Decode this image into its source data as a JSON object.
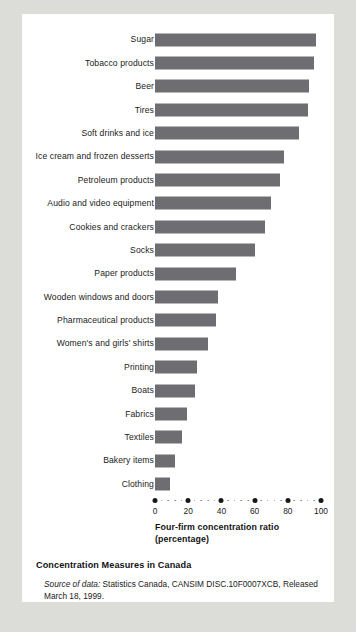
{
  "caption": {
    "title": "Concentration Measures in Canada",
    "source_lead": "Source of data:",
    "source_rest": " Statistics Canada, CANSIM DISC.10F0007XCB, Released March 18, 1999."
  },
  "colors": {
    "bar": "#6e6e72",
    "card": "#ffffff",
    "page": "#dcdcd8",
    "text": "#1b1b1b"
  },
  "chart_data": {
    "type": "bar",
    "orientation": "horizontal",
    "title": "Concentration Measures in Canada",
    "xlabel": "Four-firm concentration ratio (percentage)",
    "xlabel_line1": "Four-firm concentration ratio",
    "xlabel_line2": "(percentage)",
    "ylabel": "",
    "xlim": [
      0,
      100
    ],
    "grid": false,
    "legend": "none",
    "xticks": [
      0,
      20,
      40,
      60,
      80,
      100
    ],
    "xticklabels": [
      "0",
      "20",
      "40",
      "60",
      "80",
      "100"
    ],
    "categories": [
      "Sugar",
      "Tobacco products",
      "Beer",
      "Tires",
      "Soft drinks and ice",
      "Ice cream and frozen desserts",
      "Petroleum products",
      "Audio and video equipment",
      "Cookies and crackers",
      "Socks",
      "Paper products",
      "Wooden windows and doors",
      "Pharmaceutical products",
      "Women's and girls' shirts",
      "Printing",
      "Boats",
      "Fabrics",
      "Textiles",
      "Bakery items",
      "Clothing"
    ],
    "values": [
      97,
      96,
      93,
      92,
      87,
      78,
      75,
      70,
      66,
      60,
      49,
      38,
      37,
      32,
      25,
      24,
      19,
      16,
      12,
      9
    ]
  }
}
